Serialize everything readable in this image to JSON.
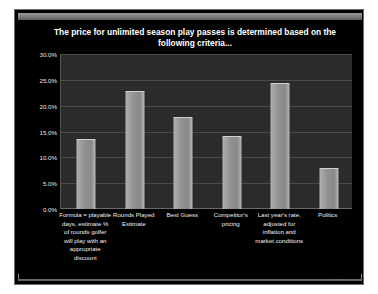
{
  "frame": {
    "watermark": "TheManagement 2013"
  },
  "chart_data": {
    "type": "bar",
    "title": "The price for unlimited season play passes is determined based on the following criteria...",
    "xlabel": "",
    "ylabel": "",
    "ylim": [
      0,
      30
    ],
    "grid": true,
    "legend": false,
    "ytick_labels": [
      "0.0%",
      "5.0%",
      "10.0%",
      "15.0%",
      "20.0%",
      "25.0%",
      "30.0%"
    ],
    "ytick_values": [
      0,
      5,
      10,
      15,
      20,
      25,
      30
    ],
    "categories": [
      "Formula = playable days, estimate % of rounds golfer will play with an appropriate discount",
      "Rounds Played Estimate",
      "Best Guess",
      "Competitor's pricing",
      "Last year's rate, adjusted for inflation and market conditions",
      "Politics"
    ],
    "values": [
      13.5,
      22.8,
      17.8,
      14.2,
      24.3,
      7.9
    ],
    "bar_color": "#9a9a9a",
    "plot_background": "#2b2b2b",
    "figure_background": "#000000",
    "text_color": "#ffffff"
  }
}
